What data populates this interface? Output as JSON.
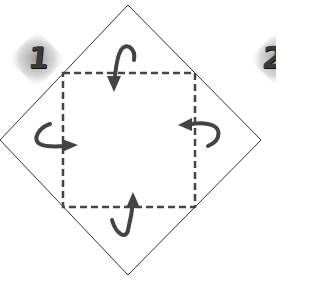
{
  "diagram": {
    "type": "origami-fold-instruction",
    "steps": [
      {
        "label": "1"
      },
      {
        "label": "2"
      }
    ],
    "shapes": {
      "paper": "diamond",
      "fold_lines": "dashed-square",
      "arrows": [
        "fold-down-top",
        "fold-right-left",
        "fold-left-right",
        "fold-up-bottom"
      ]
    },
    "colors": {
      "outline": "#333333",
      "dashed": "#444444",
      "arrow": "#444444",
      "badge": "#9a9a9a"
    }
  }
}
